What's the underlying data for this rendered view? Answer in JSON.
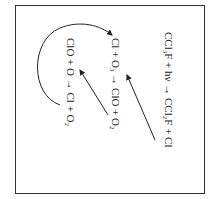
{
  "diagram": {
    "orientation": "rotated 90 degrees clockwise",
    "equations": [
      {
        "id": "photolysis",
        "parts": [
          "CCl",
          "3",
          "F + hν → CCl",
          "2",
          "F + Cl"
        ]
      },
      {
        "id": "ozone_attack",
        "parts": [
          "Cl + O",
          "3",
          " → ClO + O",
          "2"
        ]
      },
      {
        "id": "regeneration",
        "parts": [
          "ClO + O → Cl + O",
          "2"
        ]
      }
    ],
    "arrows": [
      {
        "from": "photolysis Cl product",
        "to": "ozone_attack Cl reactant",
        "type": "straight"
      },
      {
        "from": "ozone_attack ClO product",
        "to": "regeneration ClO reactant",
        "type": "straight"
      },
      {
        "from": "regeneration Cl product",
        "to": "ozone_attack Cl reactant",
        "type": "curved"
      }
    ],
    "colors": {
      "line": "#222222",
      "border": "#333333",
      "background": "#ffffff"
    }
  }
}
